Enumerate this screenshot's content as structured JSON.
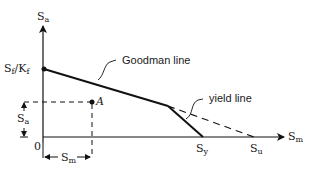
{
  "diagram": {
    "type": "modified-goodman-diagram",
    "axes": {
      "y_axis_label": {
        "main": "S",
        "sub": "a"
      },
      "x_axis_label": {
        "main": "S",
        "sub": "m"
      },
      "origin_label": "0"
    },
    "intercepts": {
      "y_intercept": {
        "label_main": "S",
        "label_sub1": "f",
        "slash": "/",
        "label_main2": "K",
        "label_sub2": "f"
      },
      "sy": {
        "main": "S",
        "sub": "y"
      },
      "su": {
        "main": "S",
        "sub": "u"
      }
    },
    "lines": {
      "goodman": "Goodman line",
      "yield": "yield line"
    },
    "point": {
      "label": "A"
    },
    "dimensions": {
      "sa": {
        "main": "S",
        "sub": "a"
      },
      "sm": {
        "main": "S",
        "sub": "m"
      }
    }
  }
}
